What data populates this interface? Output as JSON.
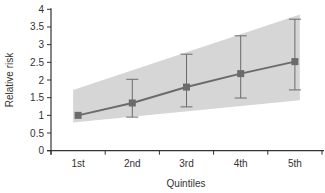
{
  "chart_data": {
    "type": "line",
    "title": "",
    "xlabel": "Quintiles",
    "ylabel": "Relative risk",
    "categories": [
      "1st",
      "2nd",
      "3rd",
      "4th",
      "5th"
    ],
    "series": [
      {
        "name": "Relative risk",
        "values": [
          1.0,
          1.35,
          1.8,
          2.18,
          2.52
        ],
        "error_lower": [
          1.0,
          0.95,
          1.24,
          1.49,
          1.72
        ],
        "error_upper": [
          1.0,
          2.02,
          2.73,
          3.25,
          3.72
        ],
        "marker": "square"
      }
    ],
    "confidence_band": {
      "x_start": "1st",
      "x_end": "5th",
      "lower_start": 0.8,
      "upper_start": 1.72,
      "lower_end": 1.43,
      "upper_end": 3.85
    },
    "ylim": [
      0,
      4
    ],
    "yticks": [
      0,
      0.5,
      1,
      1.5,
      2,
      2.5,
      3,
      3.5,
      4
    ],
    "ytick_labels": [
      "0",
      "0.5",
      "1",
      "1.5",
      "2",
      "2.5",
      "3",
      "3.5",
      "4"
    ],
    "grid": false,
    "legend": null,
    "colors": {
      "line": "#6b6b6b",
      "marker": "#6b6b6b",
      "band": "#d6d6d6",
      "axis": "#333333"
    }
  }
}
